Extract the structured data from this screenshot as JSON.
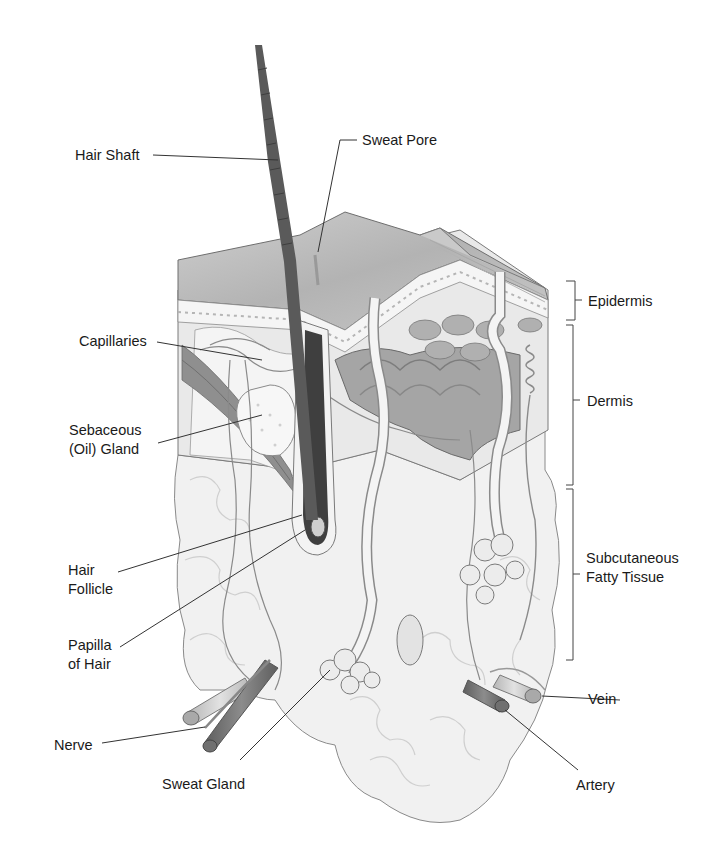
{
  "diagram": {
    "labels": {
      "hair_shaft": "Hair Shaft",
      "sweat_pore": "Sweat Pore",
      "capillaries": "Capillaries",
      "sebaceous_line1": "Sebaceous",
      "sebaceous_line2": "(Oil) Gland",
      "hair_follicle_line1": "Hair",
      "hair_follicle_line2": "Follicle",
      "papilla_line1": "Papilla",
      "papilla_line2": "of Hair",
      "nerve": "Nerve",
      "sweat_gland": "Sweat Gland",
      "artery": "Artery",
      "vein": "Vein"
    },
    "layers": {
      "epidermis": "Epidermis",
      "dermis": "Dermis",
      "subcutaneous_line1": "Subcutaneous",
      "subcutaneous_line2": "Fatty Tissue"
    },
    "colors": {
      "background": "#ffffff",
      "outline": "#6a6a6a",
      "hair": "#5a5a5a",
      "epidermis_top": "#b8b8b8",
      "dermis": "#e6e6e6",
      "fat": "#efefef",
      "artery": "#7a7a7a",
      "vein": "#c4c4c4",
      "leader_line": "#333333"
    }
  }
}
